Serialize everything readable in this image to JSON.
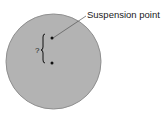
{
  "diagram": {
    "title": "",
    "disk": {
      "shape": "circle",
      "fill": "#b3b3b3",
      "stroke": "#8a8a8a"
    },
    "points": [
      {
        "name": "suspension-point",
        "label": "Suspension point"
      },
      {
        "name": "center-of-mass",
        "label": ""
      }
    ],
    "distance_label": "?",
    "annotation": "Suspension point"
  }
}
